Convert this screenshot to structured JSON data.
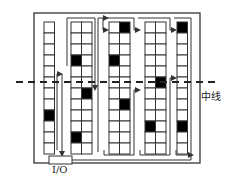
{
  "labels": {
    "midline": "中线",
    "io": "I/O"
  },
  "colors": {
    "stroke": "#333333",
    "filled": "#000000",
    "background": "#ffffff"
  },
  "outer_box": {
    "x": 34,
    "y": 13,
    "w": 166,
    "h": 150
  },
  "io_box": {
    "x": 49,
    "y": 156,
    "w": 23,
    "h": 8
  },
  "midline": {
    "y": 82,
    "x1": 16,
    "x2": 216
  },
  "grid": {
    "top": 22,
    "row_h": 11,
    "rows": 12,
    "cell_w": 10.5
  },
  "columns": [
    {
      "id": "col1",
      "x": 44,
      "cols": 1,
      "filled": [
        [
          8,
          0
        ]
      ]
    },
    {
      "id": "col2",
      "x": 71,
      "cols": 2,
      "filled": [
        [
          3,
          0
        ],
        [
          6,
          1
        ],
        [
          10,
          0
        ]
      ]
    },
    {
      "id": "col3",
      "x": 109,
      "cols": 2,
      "filled": [
        [
          0,
          1
        ],
        [
          3,
          0
        ],
        [
          7,
          1
        ]
      ]
    },
    {
      "id": "col4",
      "x": 145,
      "cols": 2,
      "filled": [
        [
          5,
          1
        ],
        [
          9,
          0
        ]
      ]
    },
    {
      "id": "col5",
      "x": 177,
      "cols": 1,
      "filled": [
        [
          0,
          0
        ],
        [
          9,
          0
        ]
      ]
    }
  ],
  "path": [
    [
      57,
      150
    ],
    [
      57,
      54
    ],
    [
      60,
      54
    ],
    [
      57,
      150
    ],
    [
      66,
      150
    ],
    [
      66,
      20
    ],
    [
      96,
      20
    ],
    [
      96,
      152
    ],
    [
      99,
      152
    ],
    [
      99,
      17
    ],
    [
      104,
      17
    ],
    [
      104,
      28
    ],
    [
      106,
      28
    ],
    [
      106,
      17
    ],
    [
      133,
      17
    ],
    [
      133,
      30
    ],
    [
      140,
      30
    ],
    [
      140,
      17
    ],
    [
      169,
      17
    ],
    [
      169,
      30
    ],
    [
      171,
      30
    ],
    [
      171,
      17
    ],
    [
      193,
      17
    ],
    [
      193,
      162
    ]
  ]
}
